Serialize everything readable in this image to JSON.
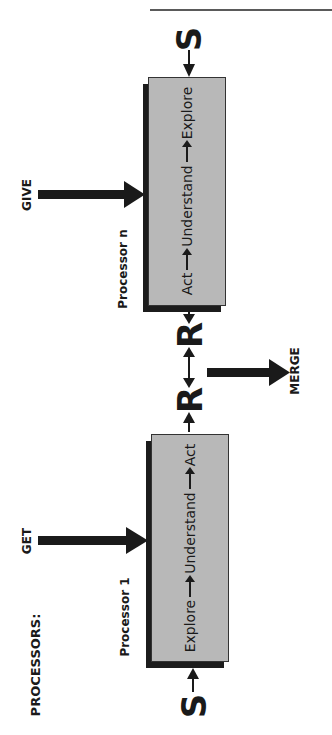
{
  "header": {
    "running_head": "THE EVOLUTION OF WEBSITES"
  },
  "diagram": {
    "title_label": "PROCESSORS:",
    "processors": [
      {
        "name": "Processor 1",
        "input_label": "GET",
        "steps": [
          "Explore",
          "Understand",
          "Act"
        ],
        "start_symbol": "S",
        "end_symbol": "R"
      },
      {
        "name": "Processor n",
        "input_label": "GIVE",
        "steps": [
          "Act",
          "Understand",
          "Explore"
        ],
        "start_symbol": "R",
        "end_symbol": "S"
      }
    ],
    "merge_label": "MERGE",
    "colors": {
      "box_fill": "#b8b8b8",
      "shadow": "#1c1c1c",
      "ink": "#1a1a1a"
    }
  }
}
